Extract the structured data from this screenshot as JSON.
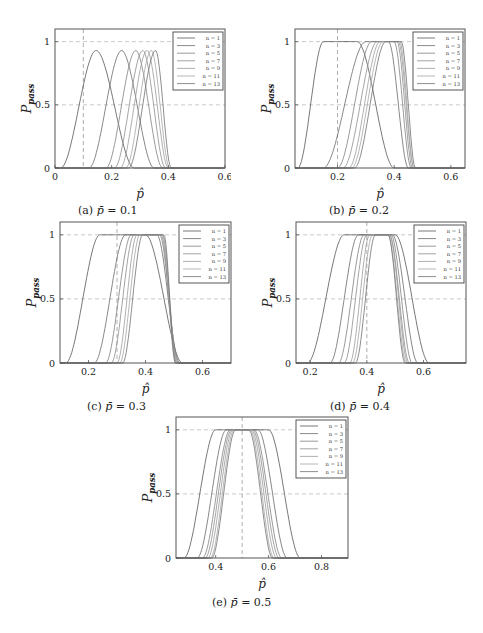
{
  "figure_caption": "Fig. 3. Pass-rate curves for various sample sizes n",
  "chart_data": [
    {
      "id": "a",
      "type": "line",
      "caption": "(a) p̄ = 0.1",
      "caption_prefix": "(a)",
      "caption_value": "0.1",
      "title": "",
      "xlabel": "p̂",
      "ylabel": "P_pass",
      "xlim": [
        0,
        0.6
      ],
      "ylim": [
        0,
        1.1
      ],
      "xticks": [
        0,
        0.2,
        0.4,
        0.6
      ],
      "xtick_labels": [
        "0",
        "0.2",
        "0.4",
        "0.6"
      ],
      "yticks": [
        0,
        0.5,
        1
      ],
      "ytick_labels": [
        "0",
        "0.5",
        "1"
      ],
      "grid": "dashed at y=0.5, y=1 and vertical reference at x=p̄",
      "reference_x": 0.1,
      "legend_position": "upper right",
      "legend": [
        "n = 1",
        "n = 3",
        "n = 5",
        "n = 7",
        "n = 9",
        "n = 11",
        "n = 13"
      ],
      "series": [
        {
          "name": "n = 1",
          "peak_x": 0.145,
          "peak_y": 0.93,
          "left_zero": 0.02,
          "right_zero": 0.28
        },
        {
          "name": "n = 3",
          "peak_x": 0.235,
          "peak_y": 0.93,
          "left_zero": 0.12,
          "right_zero": 0.35
        },
        {
          "name": "n = 5",
          "peak_x": 0.285,
          "peak_y": 0.93,
          "left_zero": 0.18,
          "right_zero": 0.38
        },
        {
          "name": "n = 7",
          "peak_x": 0.31,
          "peak_y": 0.93,
          "left_zero": 0.21,
          "right_zero": 0.39
        },
        {
          "name": "n = 9",
          "peak_x": 0.325,
          "peak_y": 0.93,
          "left_zero": 0.23,
          "right_zero": 0.4
        },
        {
          "name": "n = 11",
          "peak_x": 0.34,
          "peak_y": 0.93,
          "left_zero": 0.25,
          "right_zero": 0.405
        },
        {
          "name": "n = 13",
          "peak_x": 0.355,
          "peak_y": 0.93,
          "left_zero": 0.26,
          "right_zero": 0.41
        }
      ]
    },
    {
      "id": "b",
      "type": "line",
      "caption": "(b) p̄ = 0.2",
      "caption_prefix": "(b)",
      "caption_value": "0.2",
      "xlabel": "p̂",
      "ylabel": "P_pass",
      "xlim": [
        0.05,
        0.65
      ],
      "ylim": [
        0,
        1.1
      ],
      "xticks": [
        0.2,
        0.4,
        0.6
      ],
      "xtick_labels": [
        "0.2",
        "0.4",
        "0.6"
      ],
      "yticks": [
        0,
        0.5,
        1
      ],
      "ytick_labels": [
        "0",
        "0.5",
        "1"
      ],
      "reference_x": 0.2,
      "legend_position": "upper right",
      "legend": [
        "n = 1",
        "n = 3",
        "n = 5",
        "n = 7",
        "n = 9",
        "n = 11",
        "n = 13"
      ],
      "series": [
        {
          "name": "n = 1",
          "rise_start": 0.06,
          "plateau_start": 0.15,
          "plateau_end": 0.27,
          "fall_end": 0.4
        },
        {
          "name": "n = 3",
          "rise_start": 0.15,
          "plateau_start": 0.3,
          "plateau_end": 0.38,
          "fall_end": 0.45
        },
        {
          "name": "n = 5",
          "rise_start": 0.2,
          "plateau_start": 0.32,
          "plateau_end": 0.4,
          "fall_end": 0.46
        },
        {
          "name": "n = 7",
          "rise_start": 0.22,
          "plateau_start": 0.34,
          "plateau_end": 0.41,
          "fall_end": 0.465
        },
        {
          "name": "n = 9",
          "rise_start": 0.24,
          "plateau_start": 0.35,
          "plateau_end": 0.415,
          "fall_end": 0.47
        },
        {
          "name": "n = 11",
          "rise_start": 0.25,
          "plateau_start": 0.36,
          "plateau_end": 0.42,
          "fall_end": 0.47
        },
        {
          "name": "n = 13",
          "rise_start": 0.26,
          "plateau_start": 0.37,
          "plateau_end": 0.425,
          "fall_end": 0.475
        }
      ]
    },
    {
      "id": "c",
      "type": "line",
      "caption": "(c) p̄ = 0.3",
      "caption_prefix": "(c)",
      "caption_value": "0.3",
      "xlabel": "p̂",
      "ylabel": "P_pass",
      "xlim": [
        0.1,
        0.7
      ],
      "ylim": [
        0,
        1.1
      ],
      "xticks": [
        0.2,
        0.4,
        0.6
      ],
      "xtick_labels": [
        "0.2",
        "0.4",
        "0.6"
      ],
      "yticks": [
        0,
        0.5,
        1
      ],
      "ytick_labels": [
        "0",
        "0.5",
        "1"
      ],
      "reference_x": 0.3,
      "legend_position": "upper right",
      "legend": [
        "n = 1",
        "n = 3",
        "n = 5",
        "n = 7",
        "n = 9",
        "n = 11",
        "n = 13"
      ],
      "series": [
        {
          "name": "n = 1",
          "rise_start": 0.12,
          "plateau_start": 0.24,
          "plateau_end": 0.4,
          "fall_end": 0.53
        },
        {
          "name": "n = 3",
          "rise_start": 0.22,
          "plateau_start": 0.33,
          "plateau_end": 0.44,
          "fall_end": 0.52
        },
        {
          "name": "n = 5",
          "rise_start": 0.26,
          "plateau_start": 0.35,
          "plateau_end": 0.45,
          "fall_end": 0.515
        },
        {
          "name": "n = 7",
          "rise_start": 0.28,
          "plateau_start": 0.36,
          "plateau_end": 0.455,
          "fall_end": 0.51
        },
        {
          "name": "n = 9",
          "rise_start": 0.3,
          "plateau_start": 0.37,
          "plateau_end": 0.46,
          "fall_end": 0.51
        },
        {
          "name": "n = 11",
          "rise_start": 0.31,
          "plateau_start": 0.38,
          "plateau_end": 0.46,
          "fall_end": 0.505
        },
        {
          "name": "n = 13",
          "rise_start": 0.32,
          "plateau_start": 0.39,
          "plateau_end": 0.465,
          "fall_end": 0.505
        }
      ]
    },
    {
      "id": "d",
      "type": "line",
      "caption": "(d) p̄ = 0.4",
      "caption_prefix": "(d)",
      "caption_value": "0.4",
      "xlabel": "p̂",
      "ylabel": "P_pass",
      "xlim": [
        0.15,
        0.75
      ],
      "ylim": [
        0,
        1.1
      ],
      "xticks": [
        0.2,
        0.4,
        0.6
      ],
      "xtick_labels": [
        "0.2",
        "0.4",
        "0.6"
      ],
      "yticks": [
        0,
        0.5,
        1
      ],
      "ytick_labels": [
        "0",
        "0.5",
        "1"
      ],
      "reference_x": 0.4,
      "legend_position": "upper right",
      "legend": [
        "n = 1",
        "n = 3",
        "n = 5",
        "n = 7",
        "n = 9",
        "n = 11",
        "n = 13"
      ],
      "series": [
        {
          "name": "n = 1",
          "rise_start": 0.19,
          "plateau_start": 0.32,
          "plateau_end": 0.5,
          "fall_end": 0.62
        },
        {
          "name": "n = 3",
          "rise_start": 0.27,
          "plateau_start": 0.37,
          "plateau_end": 0.49,
          "fall_end": 0.58
        },
        {
          "name": "n = 5",
          "rise_start": 0.3,
          "plateau_start": 0.39,
          "plateau_end": 0.485,
          "fall_end": 0.56
        },
        {
          "name": "n = 7",
          "rise_start": 0.32,
          "plateau_start": 0.4,
          "plateau_end": 0.48,
          "fall_end": 0.55
        },
        {
          "name": "n = 9",
          "rise_start": 0.34,
          "plateau_start": 0.41,
          "plateau_end": 0.48,
          "fall_end": 0.545
        },
        {
          "name": "n = 11",
          "rise_start": 0.35,
          "plateau_start": 0.42,
          "plateau_end": 0.475,
          "fall_end": 0.54
        },
        {
          "name": "n = 13",
          "rise_start": 0.36,
          "plateau_start": 0.43,
          "plateau_end": 0.475,
          "fall_end": 0.535
        }
      ]
    },
    {
      "id": "e",
      "type": "line",
      "caption": "(e) p̄ = 0.5",
      "caption_prefix": "(e)",
      "caption_value": "0.5",
      "xlabel": "p̂",
      "ylabel": "P_pass",
      "xlim": [
        0.25,
        0.9
      ],
      "ylim": [
        0,
        1.1
      ],
      "xticks": [
        0.4,
        0.6,
        0.8
      ],
      "xtick_labels": [
        "0.4",
        "0.6",
        "0.8"
      ],
      "yticks": [
        0,
        0.5,
        1
      ],
      "ytick_labels": [
        "0",
        "0.5",
        "1"
      ],
      "reference_x": 0.5,
      "legend_position": "upper right",
      "legend": [
        "n = 1",
        "n = 3",
        "n = 5",
        "n = 7",
        "n = 9",
        "n = 11",
        "n = 13"
      ],
      "series": [
        {
          "name": "n = 1",
          "rise_start": 0.28,
          "plateau_start": 0.4,
          "plateau_end": 0.6,
          "fall_end": 0.72
        },
        {
          "name": "n = 3",
          "rise_start": 0.33,
          "plateau_start": 0.44,
          "plateau_end": 0.56,
          "fall_end": 0.67
        },
        {
          "name": "n = 5",
          "rise_start": 0.35,
          "plateau_start": 0.455,
          "plateau_end": 0.545,
          "fall_end": 0.65
        },
        {
          "name": "n = 7",
          "rise_start": 0.36,
          "plateau_start": 0.46,
          "plateau_end": 0.54,
          "fall_end": 0.64
        },
        {
          "name": "n = 9",
          "rise_start": 0.37,
          "plateau_start": 0.465,
          "plateau_end": 0.535,
          "fall_end": 0.63
        },
        {
          "name": "n = 11",
          "rise_start": 0.38,
          "plateau_start": 0.47,
          "plateau_end": 0.53,
          "fall_end": 0.62
        },
        {
          "name": "n = 13",
          "rise_start": 0.385,
          "plateau_start": 0.475,
          "plateau_end": 0.525,
          "fall_end": 0.615
        }
      ]
    }
  ],
  "layout": {
    "panels": {
      "a": {
        "left": 55,
        "top": 29,
        "width": 170,
        "height": 139,
        "cap_x": 78,
        "cap_y": 204
      },
      "b": {
        "left": 295,
        "top": 29,
        "width": 170,
        "height": 139,
        "cap_x": 329,
        "cap_y": 204
      },
      "c": {
        "left": 60,
        "top": 222,
        "width": 171,
        "height": 141,
        "cap_x": 87,
        "cap_y": 400
      },
      "d": {
        "left": 296,
        "top": 222,
        "width": 170,
        "height": 141,
        "cap_x": 330,
        "cap_y": 400
      },
      "e": {
        "left": 176,
        "top": 417,
        "width": 172,
        "height": 141,
        "cap_x": 212,
        "cap_y": 596
      }
    },
    "curve_colors": [
      "#555555",
      "#6a6a6a",
      "#808080",
      "#8d8d8d",
      "#9a9a9a",
      "#a5a5a5",
      "#707070"
    ],
    "frame_color": "#555555",
    "grid_color": "#bbbbbb"
  }
}
